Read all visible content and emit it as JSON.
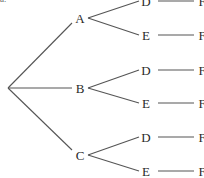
{
  "corner_mark": "a.",
  "tree": {
    "root": {
      "x": 8,
      "y": 88
    },
    "level1": [
      {
        "label": "A",
        "x": 80,
        "y": 18
      },
      {
        "label": "B",
        "x": 80,
        "y": 88
      },
      {
        "label": "C",
        "x": 80,
        "y": 155
      }
    ],
    "level2": [
      {
        "parent": 0,
        "label": "D",
        "x": 146,
        "y": 1
      },
      {
        "parent": 0,
        "label": "E",
        "x": 146,
        "y": 35
      },
      {
        "parent": 1,
        "label": "D",
        "x": 146,
        "y": 70
      },
      {
        "parent": 1,
        "label": "E",
        "x": 146,
        "y": 103
      },
      {
        "parent": 2,
        "label": "D",
        "x": 146,
        "y": 137
      },
      {
        "parent": 2,
        "label": "E",
        "x": 146,
        "y": 171
      }
    ],
    "level3": [
      {
        "parent": 0,
        "label": "F",
        "x": 202,
        "y": 1
      },
      {
        "parent": 1,
        "label": "F",
        "x": 202,
        "y": 35
      },
      {
        "parent": 2,
        "label": "F",
        "x": 202,
        "y": 70
      },
      {
        "parent": 3,
        "label": "F",
        "x": 202,
        "y": 103
      },
      {
        "parent": 4,
        "label": "F",
        "x": 202,
        "y": 137
      },
      {
        "parent": 5,
        "label": "F",
        "x": 202,
        "y": 171
      }
    ],
    "line_color": "#555555",
    "text_color": "#2a2a2a"
  }
}
